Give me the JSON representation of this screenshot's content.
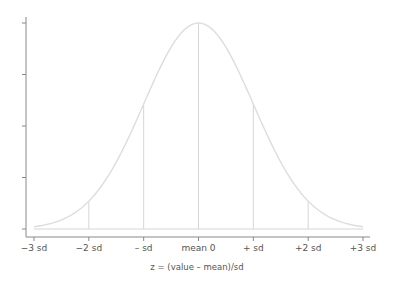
{
  "chart_data": {
    "type": "line",
    "title": "",
    "xlabel": "z = (value – mean)/sd",
    "ylabel": "",
    "xlim": [
      -3,
      3
    ],
    "ylim": [
      0,
      0.4
    ],
    "x_ticks": [
      -3,
      -2,
      -1,
      0,
      1,
      2,
      3
    ],
    "x_tick_labels": [
      "−3 sd",
      "−2 sd",
      "– sd",
      "mean 0",
      "+ sd",
      "+2 sd",
      "+3 sd"
    ],
    "y_ticks": [
      0,
      0.1,
      0.2,
      0.3,
      0.4
    ],
    "y_tick_labels": [],
    "series": [
      {
        "name": "standard normal density",
        "function": "normal_pdf",
        "mean": 0,
        "sd": 1,
        "x_range": [
          -3,
          3
        ]
      }
    ],
    "reference_lines": [
      {
        "x": -2,
        "label": "−2 sd"
      },
      {
        "x": -1,
        "label": "– sd"
      },
      {
        "x": 0,
        "label": "mean 0"
      },
      {
        "x": 1,
        "label": "+ sd"
      },
      {
        "x": 2,
        "label": "+2 sd"
      }
    ],
    "baseline_y": 0,
    "grid": false,
    "legend": "none",
    "colors": {
      "curve": "#dddddd",
      "reference": "#d6d6d6",
      "axis": "#888888",
      "text": "#555555"
    }
  }
}
